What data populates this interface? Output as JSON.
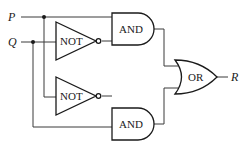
{
  "diagram": {
    "type": "logic-circuit",
    "inputs": [
      {
        "id": "P",
        "label": "P"
      },
      {
        "id": "Q",
        "label": "Q"
      }
    ],
    "output": {
      "id": "R",
      "label": "R"
    },
    "gates": [
      {
        "id": "not1",
        "type": "NOT",
        "label": "NOT",
        "input": "Q"
      },
      {
        "id": "and1",
        "type": "AND",
        "label": "AND",
        "inputs": [
          "P",
          "not1"
        ]
      },
      {
        "id": "not2",
        "type": "NOT",
        "label": "NOT",
        "input": "P"
      },
      {
        "id": "and2",
        "type": "AND",
        "label": "AND",
        "inputs": [
          "not2",
          "Q"
        ]
      },
      {
        "id": "or1",
        "type": "OR",
        "label": "OR",
        "inputs": [
          "and1",
          "and2"
        ],
        "output": "R"
      }
    ],
    "colors": {
      "line": "#1a1a1a",
      "background": "#ffffff"
    }
  }
}
